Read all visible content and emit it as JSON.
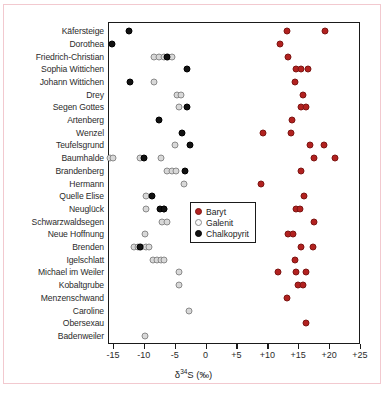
{
  "chart_data": {
    "type": "scatter",
    "title": "",
    "xlabel": "δ³⁴S (‰)",
    "ylabel": "",
    "xlim": [
      -15.8,
      25.0
    ],
    "xticks": [
      -15,
      -10,
      -5,
      0,
      5,
      10,
      15,
      20,
      25
    ],
    "xtick_labels": [
      "-15",
      "-10",
      "-5",
      "0",
      "+5",
      "+10",
      "+15",
      "+20",
      "+25"
    ],
    "grid": false,
    "legend_position": "center-right-inside",
    "categories": [
      "Käfersteige",
      "Dorothea",
      "Friedrich-Christian",
      "Sophia Wittichen",
      "Johann Wittichen",
      "Drey",
      "Segen Gottes",
      "Artenberg",
      "Wenzel",
      "Teufelsgrund",
      "Baumhalde",
      "Brandenberg",
      "Hermann",
      "Quelle Elise",
      "Neuglück",
      "Schwarzwaldsegen",
      "Neue Hoffnung",
      "Brenden",
      "Igelschlatt",
      "Michael im Weiler",
      "Kobaltgrube",
      "Menzenschwand",
      "Caroline",
      "Obersexau",
      "Badenweiler"
    ],
    "series": [
      {
        "name": "Baryt",
        "color": "#b2211f",
        "marker": "filled-circle",
        "points": [
          {
            "category": "Käfersteige",
            "x": 13.1
          },
          {
            "category": "Käfersteige",
            "x": 19.4
          },
          {
            "category": "Dorothea",
            "x": 12.1
          },
          {
            "category": "Friedrich-Christian",
            "x": 13.4
          },
          {
            "category": "Sophia Wittichen",
            "x": 14.6
          },
          {
            "category": "Sophia Wittichen",
            "x": 15.4
          },
          {
            "category": "Sophia Wittichen",
            "x": 16.6
          },
          {
            "category": "Johann Wittichen",
            "x": 14.4
          },
          {
            "category": "Drey",
            "x": 15.8
          },
          {
            "category": "Segen Gottes",
            "x": 15.4
          },
          {
            "category": "Segen Gottes",
            "x": 16.2
          },
          {
            "category": "Artenberg",
            "x": 14.0
          },
          {
            "category": "Wenzel",
            "x": 9.3
          },
          {
            "category": "Wenzel",
            "x": 13.9
          },
          {
            "category": "Teufelsgrund",
            "x": 16.9
          },
          {
            "category": "Teufelsgrund",
            "x": 19.1
          },
          {
            "category": "Baumhalde",
            "x": 17.5
          },
          {
            "category": "Baumhalde",
            "x": 21.0
          },
          {
            "category": "Brandenberg",
            "x": 15.4
          },
          {
            "category": "Hermann",
            "x": 8.9
          },
          {
            "category": "Quelle Elise",
            "x": 15.9
          },
          {
            "category": "Neuglück",
            "x": 14.6
          },
          {
            "category": "Neuglück",
            "x": 15.3
          },
          {
            "category": "Schwarzwaldsegen",
            "x": 17.5
          },
          {
            "category": "Neue Hoffnung",
            "x": 13.4
          },
          {
            "category": "Neue Hoffnung",
            "x": 14.1
          },
          {
            "category": "Brenden",
            "x": 15.5
          },
          {
            "category": "Brenden",
            "x": 17.4
          },
          {
            "category": "Igelschlatt",
            "x": 14.5
          },
          {
            "category": "Michael im Weiler",
            "x": 11.7
          },
          {
            "category": "Michael im Weiler",
            "x": 14.6
          },
          {
            "category": "Michael im Weiler",
            "x": 16.3
          },
          {
            "category": "Kobaltgrube",
            "x": 14.9
          },
          {
            "category": "Kobaltgrube",
            "x": 15.7
          },
          {
            "category": "Menzenschwand",
            "x": 13.1
          },
          {
            "category": "Obersexau",
            "x": 16.3
          }
        ]
      },
      {
        "name": "Galenit",
        "color": "#d8d8d8",
        "marker": "open-circle",
        "points": [
          {
            "category": "Friedrich-Christian",
            "x": -8.3
          },
          {
            "category": "Friedrich-Christian",
            "x": -7.5
          },
          {
            "category": "Friedrich-Christian",
            "x": -6.8
          },
          {
            "category": "Friedrich-Christian",
            "x": -6.1
          },
          {
            "category": "Friedrich-Christian",
            "x": -5.5
          },
          {
            "category": "Johann Wittichen",
            "x": -8.4
          },
          {
            "category": "Drey",
            "x": -4.7
          },
          {
            "category": "Drey",
            "x": -4.0
          },
          {
            "category": "Segen Gottes",
            "x": -4.3
          },
          {
            "category": "Teufelsgrund",
            "x": -5.0
          },
          {
            "category": "Baumhalde",
            "x": -15.5
          },
          {
            "category": "Baumhalde",
            "x": -15.0
          },
          {
            "category": "Baumhalde",
            "x": -10.7
          },
          {
            "category": "Baumhalde",
            "x": -7.3
          },
          {
            "category": "Brandenberg",
            "x": -6.2
          },
          {
            "category": "Brandenberg",
            "x": -5.5
          },
          {
            "category": "Brandenberg",
            "x": -4.8
          },
          {
            "category": "Hermann",
            "x": -3.5
          },
          {
            "category": "Quelle Elise",
            "x": -9.6
          },
          {
            "category": "Neuglück",
            "x": -9.7
          },
          {
            "category": "Neuglück",
            "x": -6.8
          },
          {
            "category": "Schwarzwaldsegen",
            "x": -7.0
          },
          {
            "category": "Schwarzwaldsegen",
            "x": -6.2
          },
          {
            "category": "Neue Hoffnung",
            "x": -9.8
          },
          {
            "category": "Brenden",
            "x": -11.6
          },
          {
            "category": "Brenden",
            "x": -11.0
          },
          {
            "category": "Brenden",
            "x": -10.4
          },
          {
            "category": "Brenden",
            "x": -9.7
          },
          {
            "category": "Brenden",
            "x": -9.1
          },
          {
            "category": "Igelschlatt",
            "x": -8.5
          },
          {
            "category": "Igelschlatt",
            "x": -7.9
          },
          {
            "category": "Igelschlatt",
            "x": -7.3
          },
          {
            "category": "Igelschlatt",
            "x": -6.7
          },
          {
            "category": "Michael im Weiler",
            "x": -4.3
          },
          {
            "category": "Kobaltgrube",
            "x": -4.3
          },
          {
            "category": "Caroline",
            "x": -2.7
          },
          {
            "category": "Badenweiler",
            "x": -9.8
          }
        ]
      },
      {
        "name": "Chalkopyrit",
        "color": "#121212",
        "marker": "filled-circle",
        "points": [
          {
            "category": "Käfersteige",
            "x": -12.4
          },
          {
            "category": "Dorothea",
            "x": -15.2
          },
          {
            "category": "Friedrich-Christian",
            "x": -6.2
          },
          {
            "category": "Sophia Wittichen",
            "x": -3.0
          },
          {
            "category": "Johann Wittichen",
            "x": -12.2
          },
          {
            "category": "Segen Gottes",
            "x": -3.0
          },
          {
            "category": "Artenberg",
            "x": -7.6
          },
          {
            "category": "Wenzel",
            "x": -3.9
          },
          {
            "category": "Teufelsgrund",
            "x": -2.6
          },
          {
            "category": "Baumhalde",
            "x": -10.0
          },
          {
            "category": "Brandenberg",
            "x": -3.3
          },
          {
            "category": "Quelle Elise",
            "x": -8.7
          },
          {
            "category": "Neuglück",
            "x": -7.4
          },
          {
            "category": "Neuglück",
            "x": -6.8
          },
          {
            "category": "Brenden",
            "x": -10.6
          }
        ]
      }
    ]
  },
  "legend": {
    "items": [
      {
        "label": "Baryt",
        "key": "baryt"
      },
      {
        "label": "Galenit",
        "key": "galenit"
      },
      {
        "label": "Chalkopyrit",
        "key": "chalkopyrit"
      }
    ]
  },
  "axis": {
    "x_title_delta": "δ",
    "x_title_sup": "34",
    "x_title_rest": "S (‰)"
  }
}
